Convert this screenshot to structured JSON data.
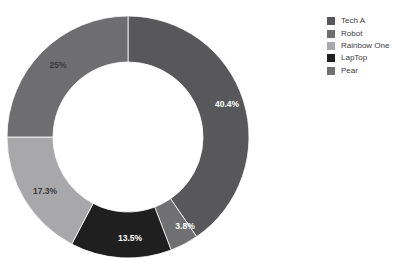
{
  "chart_data": {
    "type": "pie",
    "variant": "donut",
    "title": "",
    "xlabel": "",
    "ylabel": "",
    "categories": [
      "Tech A",
      "Robot",
      "Rainbow One",
      "LapTop",
      "Pear"
    ],
    "values": [
      40.4,
      25,
      17.3,
      13.5,
      3.8
    ],
    "value_labels": [
      "40.4%",
      "25%",
      "17.3%",
      "13.5%",
      "3.8%"
    ],
    "units": "percent",
    "start_angle_deg": 0,
    "direction": "clockwise",
    "inner_radius_ratio": 0.62,
    "grid": false,
    "legend_position": "right",
    "colors": [
      "#58585a",
      "#6e6e70",
      "#a8a8aa",
      "#1f1f20",
      "#707072"
    ],
    "slices": [
      {
        "label": "Tech A",
        "value": 40.4,
        "value_label": "40.4%",
        "color": "#58585a",
        "label_color": "#ffffff",
        "start_deg": 0,
        "end_deg": 145.44,
        "label_x": 227,
        "label_y": 105
      },
      {
        "label": "Pear",
        "value": 3.8,
        "value_label": "3.8%",
        "color": "#707072",
        "label_color": "#ffffff",
        "start_deg": 145.44,
        "end_deg": 159.12,
        "label_x": 185,
        "label_y": 227
      },
      {
        "label": "LapTop",
        "value": 13.5,
        "value_label": "13.5%",
        "color": "#1f1f20",
        "label_color": "#ffffff",
        "start_deg": 159.12,
        "end_deg": 207.72,
        "label_x": 130,
        "label_y": 239
      },
      {
        "label": "Rainbow One",
        "value": 17.3,
        "value_label": "17.3%",
        "color": "#a8a8aa",
        "label_color": "#3a3a3c",
        "start_deg": 207.72,
        "end_deg": 270.0,
        "label_x": 45,
        "label_y": 192
      },
      {
        "label": "Robot",
        "value": 25,
        "value_label": "25%",
        "color": "#6e6e70",
        "label_color": "#3a3a3c",
        "start_deg": 270.0,
        "end_deg": 360.0,
        "label_x": 58,
        "label_y": 66
      }
    ],
    "geometry": {
      "center_x": 128,
      "center_y": 137,
      "outer_radius": 121,
      "inner_radius": 75
    }
  },
  "legend": {
    "items": [
      {
        "label": "Tech A",
        "color": "#58585a"
      },
      {
        "label": "Robot",
        "color": "#6e6e70"
      },
      {
        "label": "Rainbow One",
        "color": "#a8a8aa"
      },
      {
        "label": "LapTop",
        "color": "#1f1f20"
      },
      {
        "label": "Pear",
        "color": "#707072"
      }
    ]
  },
  "title_fragment": ""
}
